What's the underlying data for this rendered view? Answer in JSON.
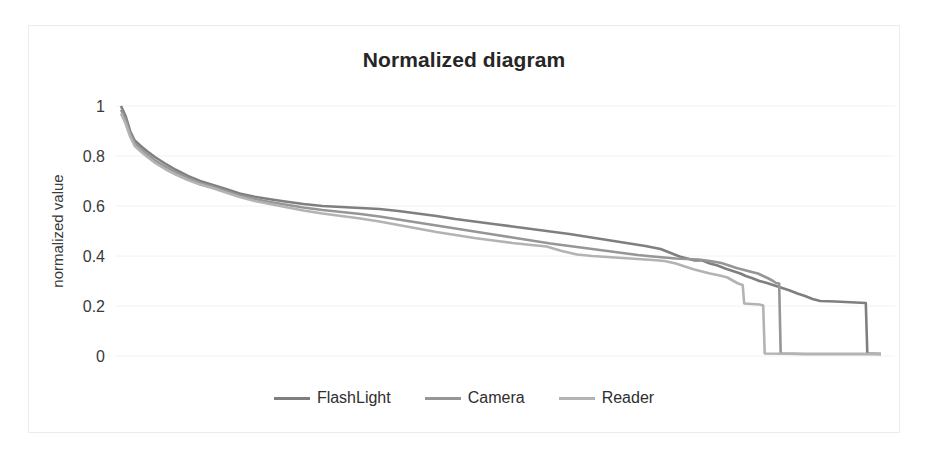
{
  "chart": {
    "title": "Normalized diagram",
    "frame_border_color": "#ebebeb",
    "background": "#ffffff"
  },
  "axis": {
    "y_label": "normalized value",
    "y_ticks": [
      "0",
      "0.2",
      "0.4",
      "0.6",
      "0.8",
      "1"
    ]
  },
  "legend": {
    "items": [
      {
        "label": "FlashLight",
        "color": "#7f7f7f"
      },
      {
        "label": "Camera",
        "color": "#969696"
      },
      {
        "label": "Reader",
        "color": "#b3b3b3"
      }
    ]
  },
  "chart_data": {
    "type": "line",
    "title": "Normalized diagram",
    "xlabel": "",
    "ylabel": "normalized value",
    "ylim": [
      0,
      1
    ],
    "xlim": [
      0,
      1
    ],
    "grid": true,
    "legend_position": "bottom",
    "x_tick_labels": [],
    "y_tick_labels": [
      "0",
      "0.2",
      "0.4",
      "0.6",
      "0.8",
      "1"
    ],
    "series": [
      {
        "name": "FlashLight",
        "color": "#7f7f7f",
        "points": [
          [
            0.0,
            1.0
          ],
          [
            0.006,
            0.96
          ],
          [
            0.012,
            0.9
          ],
          [
            0.018,
            0.862
          ],
          [
            0.026,
            0.84
          ],
          [
            0.034,
            0.82
          ],
          [
            0.045,
            0.795
          ],
          [
            0.058,
            0.77
          ],
          [
            0.072,
            0.745
          ],
          [
            0.088,
            0.72
          ],
          [
            0.104,
            0.7
          ],
          [
            0.12,
            0.685
          ],
          [
            0.138,
            0.668
          ],
          [
            0.156,
            0.65
          ],
          [
            0.176,
            0.637
          ],
          [
            0.196,
            0.627
          ],
          [
            0.216,
            0.618
          ],
          [
            0.24,
            0.608
          ],
          [
            0.265,
            0.6
          ],
          [
            0.29,
            0.596
          ],
          [
            0.315,
            0.592
          ],
          [
            0.34,
            0.588
          ],
          [
            0.365,
            0.58
          ],
          [
            0.39,
            0.57
          ],
          [
            0.415,
            0.56
          ],
          [
            0.44,
            0.548
          ],
          [
            0.465,
            0.538
          ],
          [
            0.49,
            0.528
          ],
          [
            0.515,
            0.518
          ],
          [
            0.54,
            0.508
          ],
          [
            0.565,
            0.498
          ],
          [
            0.59,
            0.488
          ],
          [
            0.615,
            0.476
          ],
          [
            0.64,
            0.464
          ],
          [
            0.665,
            0.452
          ],
          [
            0.69,
            0.44
          ],
          [
            0.71,
            0.428
          ],
          [
            0.725,
            0.41
          ],
          [
            0.735,
            0.398
          ],
          [
            0.745,
            0.39
          ],
          [
            0.755,
            0.382
          ],
          [
            0.765,
            0.382
          ],
          [
            0.775,
            0.37
          ],
          [
            0.785,
            0.362
          ],
          [
            0.795,
            0.35
          ],
          [
            0.805,
            0.34
          ],
          [
            0.815,
            0.33
          ],
          [
            0.822,
            0.32
          ],
          [
            0.83,
            0.312
          ],
          [
            0.84,
            0.3
          ],
          [
            0.85,
            0.292
          ],
          [
            0.86,
            0.282
          ],
          [
            0.87,
            0.272
          ],
          [
            0.88,
            0.262
          ],
          [
            0.89,
            0.25
          ],
          [
            0.9,
            0.24
          ],
          [
            0.91,
            0.228
          ],
          [
            0.92,
            0.22
          ],
          [
            0.94,
            0.218
          ],
          [
            0.96,
            0.215
          ],
          [
            0.98,
            0.212
          ],
          [
            0.982,
            0.01
          ],
          [
            1.0,
            0.008
          ]
        ]
      },
      {
        "name": "Camera",
        "color": "#969696",
        "points": [
          [
            0.0,
            0.985
          ],
          [
            0.006,
            0.945
          ],
          [
            0.012,
            0.89
          ],
          [
            0.018,
            0.85
          ],
          [
            0.026,
            0.828
          ],
          [
            0.034,
            0.808
          ],
          [
            0.045,
            0.782
          ],
          [
            0.058,
            0.758
          ],
          [
            0.072,
            0.735
          ],
          [
            0.088,
            0.712
          ],
          [
            0.104,
            0.692
          ],
          [
            0.12,
            0.678
          ],
          [
            0.138,
            0.66
          ],
          [
            0.156,
            0.642
          ],
          [
            0.176,
            0.628
          ],
          [
            0.196,
            0.616
          ],
          [
            0.216,
            0.606
          ],
          [
            0.24,
            0.594
          ],
          [
            0.265,
            0.584
          ],
          [
            0.29,
            0.576
          ],
          [
            0.315,
            0.568
          ],
          [
            0.34,
            0.558
          ],
          [
            0.365,
            0.546
          ],
          [
            0.39,
            0.534
          ],
          [
            0.415,
            0.522
          ],
          [
            0.44,
            0.51
          ],
          [
            0.465,
            0.498
          ],
          [
            0.49,
            0.486
          ],
          [
            0.515,
            0.474
          ],
          [
            0.54,
            0.462
          ],
          [
            0.565,
            0.45
          ],
          [
            0.59,
            0.44
          ],
          [
            0.615,
            0.43
          ],
          [
            0.64,
            0.42
          ],
          [
            0.66,
            0.412
          ],
          [
            0.68,
            0.404
          ],
          [
            0.7,
            0.398
          ],
          [
            0.715,
            0.394
          ],
          [
            0.73,
            0.39
          ],
          [
            0.745,
            0.388
          ],
          [
            0.76,
            0.386
          ],
          [
            0.775,
            0.38
          ],
          [
            0.79,
            0.372
          ],
          [
            0.8,
            0.362
          ],
          [
            0.81,
            0.352
          ],
          [
            0.82,
            0.344
          ],
          [
            0.83,
            0.336
          ],
          [
            0.838,
            0.33
          ],
          [
            0.845,
            0.32
          ],
          [
            0.852,
            0.31
          ],
          [
            0.858,
            0.3
          ],
          [
            0.862,
            0.292
          ],
          [
            0.866,
            0.29
          ],
          [
            0.868,
            0.01
          ],
          [
            0.9,
            0.008
          ],
          [
            1.0,
            0.008
          ]
        ]
      },
      {
        "name": "Reader",
        "color": "#b3b3b3",
        "points": [
          [
            0.0,
            0.97
          ],
          [
            0.006,
            0.93
          ],
          [
            0.012,
            0.878
          ],
          [
            0.018,
            0.84
          ],
          [
            0.026,
            0.818
          ],
          [
            0.034,
            0.798
          ],
          [
            0.045,
            0.772
          ],
          [
            0.058,
            0.748
          ],
          [
            0.072,
            0.726
          ],
          [
            0.088,
            0.704
          ],
          [
            0.104,
            0.686
          ],
          [
            0.12,
            0.672
          ],
          [
            0.138,
            0.654
          ],
          [
            0.156,
            0.636
          ],
          [
            0.176,
            0.62
          ],
          [
            0.196,
            0.608
          ],
          [
            0.216,
            0.596
          ],
          [
            0.24,
            0.582
          ],
          [
            0.265,
            0.57
          ],
          [
            0.29,
            0.56
          ],
          [
            0.315,
            0.55
          ],
          [
            0.34,
            0.538
          ],
          [
            0.365,
            0.524
          ],
          [
            0.39,
            0.51
          ],
          [
            0.415,
            0.496
          ],
          [
            0.44,
            0.484
          ],
          [
            0.465,
            0.472
          ],
          [
            0.49,
            0.462
          ],
          [
            0.515,
            0.452
          ],
          [
            0.54,
            0.444
          ],
          [
            0.56,
            0.438
          ],
          [
            0.58,
            0.42
          ],
          [
            0.6,
            0.406
          ],
          [
            0.62,
            0.4
          ],
          [
            0.64,
            0.396
          ],
          [
            0.66,
            0.392
          ],
          [
            0.68,
            0.388
          ],
          [
            0.7,
            0.384
          ],
          [
            0.715,
            0.38
          ],
          [
            0.73,
            0.37
          ],
          [
            0.742,
            0.358
          ],
          [
            0.752,
            0.348
          ],
          [
            0.762,
            0.34
          ],
          [
            0.775,
            0.33
          ],
          [
            0.788,
            0.322
          ],
          [
            0.798,
            0.314
          ],
          [
            0.806,
            0.3
          ],
          [
            0.812,
            0.29
          ],
          [
            0.818,
            0.284
          ],
          [
            0.82,
            0.21
          ],
          [
            0.84,
            0.206
          ],
          [
            0.845,
            0.202
          ],
          [
            0.847,
            0.01
          ],
          [
            0.9,
            0.008
          ],
          [
            1.0,
            0.008
          ]
        ]
      }
    ]
  }
}
